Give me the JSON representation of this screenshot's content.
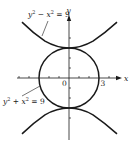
{
  "figure": {
    "type": "conic-sections-diagram",
    "axes": {
      "x_label": "x",
      "y_label": "y",
      "origin_label": "0",
      "x_tick_label": "3",
      "x_ticks": [
        -5,
        -4,
        -3,
        -2,
        -1,
        1,
        2,
        3,
        4,
        5
      ],
      "y_ticks": [
        -4,
        -3,
        -2,
        -1,
        1,
        2,
        3,
        4
      ]
    },
    "curves": [
      {
        "name": "hyperbola",
        "equation_parts": {
          "a": "y",
          "a_exp": "2",
          "op": " − ",
          "b": "x",
          "b_exp": "2",
          "rhs": " = 9"
        },
        "equation": "y^2 - x^2 = 9",
        "vertices": [
          [
            0,
            3
          ],
          [
            0,
            -3
          ]
        ]
      },
      {
        "name": "circle",
        "equation_parts": {
          "a": "y",
          "a_exp": "2",
          "op": " + ",
          "b": "x",
          "b_exp": "2",
          "rhs": " = 9"
        },
        "equation": "y^2 + x^2 = 9",
        "radius": 3,
        "center": [
          0,
          0
        ]
      }
    ],
    "colors": {
      "stroke": "#1a1a1a",
      "background": "#ffffff"
    }
  }
}
